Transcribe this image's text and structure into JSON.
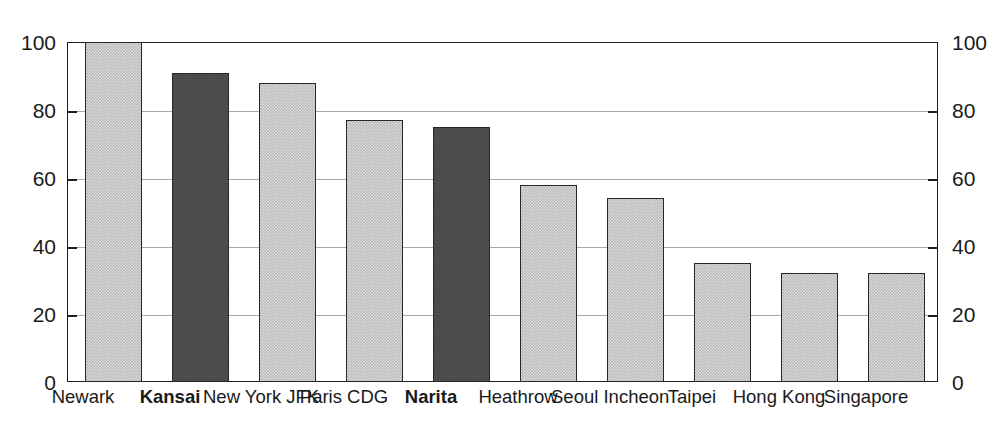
{
  "chart_data": {
    "type": "bar",
    "title": "",
    "subtitle": "",
    "xlabel": "",
    "ylabel": "",
    "categories": [
      "Newark",
      "Kansai",
      "New York JFK",
      "Paris CDG",
      "Narita",
      "Heathrow",
      "Seoul Incheon",
      "Taipei",
      "Hong Kong",
      "Singapore"
    ],
    "values": [
      100,
      91,
      88,
      77,
      75,
      58,
      54,
      35,
      32,
      32
    ],
    "highlighted": [
      false,
      true,
      false,
      false,
      true,
      false,
      false,
      false,
      false,
      false
    ],
    "ylim": [
      0,
      100
    ],
    "yticks": [
      0,
      20,
      40,
      60,
      80,
      100
    ],
    "ytick_labels": [
      "0",
      "20",
      "40",
      "60",
      "80",
      "100"
    ],
    "grid": true,
    "grid_axis": "y",
    "legend": "none",
    "dual_y_axis": true,
    "left_axis_labels": [
      "0",
      "20",
      "40",
      "60",
      "80",
      "100"
    ],
    "right_axis_labels": [
      "0",
      "20",
      "40",
      "60",
      "80",
      "100"
    ],
    "series": [
      {
        "name": "value",
        "values": [
          100,
          91,
          88,
          77,
          75,
          58,
          54,
          35,
          32,
          32
        ]
      }
    ],
    "colors": {
      "bar_light_fill": "#b9b9b9",
      "bar_dark_fill": "#4a4a4a",
      "bar_border": "#262626",
      "gridline": "#a8a8a8",
      "axis": "#1d1d1d",
      "text": "#1a1a1a",
      "background": "#ffffff"
    }
  }
}
